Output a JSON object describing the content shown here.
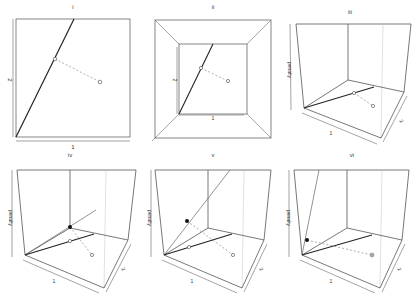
{
  "figure": {
    "panels": [
      {
        "id": "i",
        "title": "i",
        "x_label": "1",
        "y_label": "2",
        "view": "2d-top"
      },
      {
        "id": "ii",
        "title": "ii",
        "x_label": "1",
        "y_label": "2",
        "view": "3d-top-down"
      },
      {
        "id": "iii",
        "title": "iii",
        "x_label": "1",
        "y_label": "2",
        "z_label": "penalty",
        "view": "3d-perspective"
      },
      {
        "id": "iv",
        "title": "iv",
        "x_label": "1",
        "y_label": "2",
        "z_label": "penalty",
        "view": "3d-perspective"
      },
      {
        "id": "v",
        "title": "v",
        "x_label": "1",
        "y_label": "2",
        "z_label": "penalty",
        "view": "3d-perspective"
      },
      {
        "id": "vi",
        "title": "vi",
        "x_label": "1",
        "y_label": "2",
        "z_label": "penalty",
        "view": "3d-perspective"
      }
    ],
    "colors": {
      "frame": "#555555",
      "line": "#222222",
      "dashed": "#777777",
      "light": "#bbbbbb"
    }
  }
}
